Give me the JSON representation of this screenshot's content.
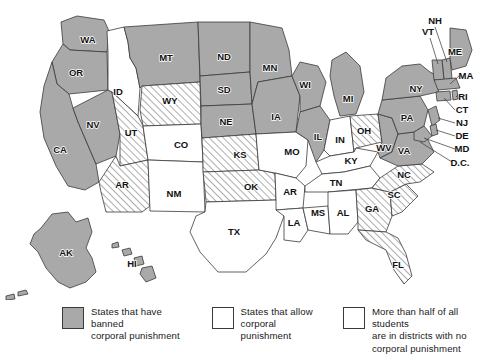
{
  "map": {
    "title": "",
    "colors": {
      "banned_fill": "#a9a9a9",
      "allow_fill": "#ffffff",
      "hatch_line": "#4a4a4a",
      "border": "#3a3a3a",
      "background": "#ffffff"
    },
    "categories": {
      "banned": "States that have banned corporal punishment",
      "allow": "States that allow corporal punishment",
      "hatched": "More than half of all students are in districts with no corporal punishment"
    },
    "states": [
      {
        "code": "WA",
        "category": "banned",
        "label_x": 88,
        "label_y": 40
      },
      {
        "code": "OR",
        "category": "banned",
        "label_x": 76,
        "label_y": 73
      },
      {
        "code": "CA",
        "category": "banned",
        "label_x": 60,
        "label_y": 150
      },
      {
        "code": "NV",
        "category": "banned",
        "label_x": 93,
        "label_y": 125
      },
      {
        "code": "ID",
        "category": "allow",
        "label_x": 118,
        "label_y": 92
      },
      {
        "code": "MT",
        "category": "banned",
        "label_x": 166,
        "label_y": 58
      },
      {
        "code": "WY",
        "category": "hatched",
        "label_x": 170,
        "label_y": 101
      },
      {
        "code": "UT",
        "category": "hatched",
        "label_x": 131,
        "label_y": 133
      },
      {
        "code": "AZ",
        "category": "hatched",
        "label_x": 122,
        "label_y": 185,
        "display": "AR"
      },
      {
        "code": "CO",
        "category": "allow",
        "label_x": 181,
        "label_y": 145
      },
      {
        "code": "NM",
        "category": "allow",
        "label_x": 174,
        "label_y": 194
      },
      {
        "code": "ND",
        "category": "banned",
        "label_x": 224,
        "label_y": 57
      },
      {
        "code": "SD",
        "category": "banned",
        "label_x": 224,
        "label_y": 90
      },
      {
        "code": "NE",
        "category": "banned",
        "label_x": 226,
        "label_y": 122
      },
      {
        "code": "KS",
        "category": "hatched",
        "label_x": 240,
        "label_y": 155
      },
      {
        "code": "OK",
        "category": "hatched",
        "label_x": 251,
        "label_y": 187
      },
      {
        "code": "TX",
        "category": "allow",
        "label_x": 234,
        "label_y": 232
      },
      {
        "code": "MN",
        "category": "banned",
        "label_x": 270,
        "label_y": 68
      },
      {
        "code": "IA",
        "category": "banned",
        "label_x": 276,
        "label_y": 117
      },
      {
        "code": "MO",
        "category": "allow",
        "label_x": 292,
        "label_y": 152
      },
      {
        "code": "AR",
        "category": "allow",
        "label_x": 290,
        "label_y": 192
      },
      {
        "code": "LA",
        "category": "allow",
        "label_x": 294,
        "label_y": 223
      },
      {
        "code": "WI",
        "category": "banned",
        "label_x": 305,
        "label_y": 85
      },
      {
        "code": "IL",
        "category": "banned",
        "label_x": 318,
        "label_y": 137
      },
      {
        "code": "MS",
        "category": "allow",
        "label_x": 318,
        "label_y": 213
      },
      {
        "code": "MI",
        "category": "banned",
        "label_x": 348,
        "label_y": 99
      },
      {
        "code": "IN",
        "category": "allow",
        "label_x": 340,
        "label_y": 140
      },
      {
        "code": "OH",
        "category": "hatched",
        "label_x": 364,
        "label_y": 131
      },
      {
        "code": "KY",
        "category": "allow",
        "label_x": 351,
        "label_y": 161
      },
      {
        "code": "TN",
        "category": "allow",
        "label_x": 336,
        "label_y": 183
      },
      {
        "code": "AL",
        "category": "allow",
        "label_x": 343,
        "label_y": 213
      },
      {
        "code": "GA",
        "category": "hatched",
        "label_x": 372,
        "label_y": 209
      },
      {
        "code": "FL",
        "category": "hatched",
        "label_x": 398,
        "label_y": 265
      },
      {
        "code": "SC",
        "category": "hatched",
        "label_x": 394,
        "label_y": 195
      },
      {
        "code": "NC",
        "category": "hatched",
        "label_x": 404,
        "label_y": 175
      },
      {
        "code": "WV",
        "category": "banned",
        "label_x": 384,
        "label_y": 148
      },
      {
        "code": "VA",
        "category": "banned",
        "label_x": 404,
        "label_y": 151
      },
      {
        "code": "PA",
        "category": "banned",
        "label_x": 407,
        "label_y": 118
      },
      {
        "code": "NY",
        "category": "banned",
        "label_x": 416,
        "label_y": 89
      },
      {
        "code": "ME",
        "category": "banned",
        "label_x": 455,
        "label_y": 52
      },
      {
        "code": "AK",
        "category": "banned",
        "label_x": 66,
        "label_y": 253
      },
      {
        "code": "HI",
        "category": "banned",
        "label_x": 132,
        "label_y": 264
      }
    ],
    "callout_labels": [
      {
        "code": "NH",
        "label_x": 435,
        "label_y": 21
      },
      {
        "code": "VT",
        "label_x": 428,
        "label_y": 32
      },
      {
        "code": "MA",
        "label_x": 466,
        "label_y": 76
      },
      {
        "code": "RI",
        "label_x": 463,
        "label_y": 97
      },
      {
        "code": "CT",
        "label_x": 462,
        "label_y": 110
      },
      {
        "code": "NJ",
        "label_x": 462,
        "label_y": 123
      },
      {
        "code": "DE",
        "label_x": 462,
        "label_y": 136
      },
      {
        "code": "MD",
        "label_x": 462,
        "label_y": 149
      },
      {
        "code": "D.C.",
        "label_x": 460,
        "label_y": 163
      }
    ]
  },
  "legend": {
    "items": [
      {
        "swatch": "banned",
        "text": "States that have banned\ncorporal punishment"
      },
      {
        "swatch": "allow",
        "text": "States that allow\ncorporal punishment"
      },
      {
        "swatch": "hatched",
        "text": "More than half of all students\nare in districts with no\ncorporal punishment"
      }
    ]
  }
}
